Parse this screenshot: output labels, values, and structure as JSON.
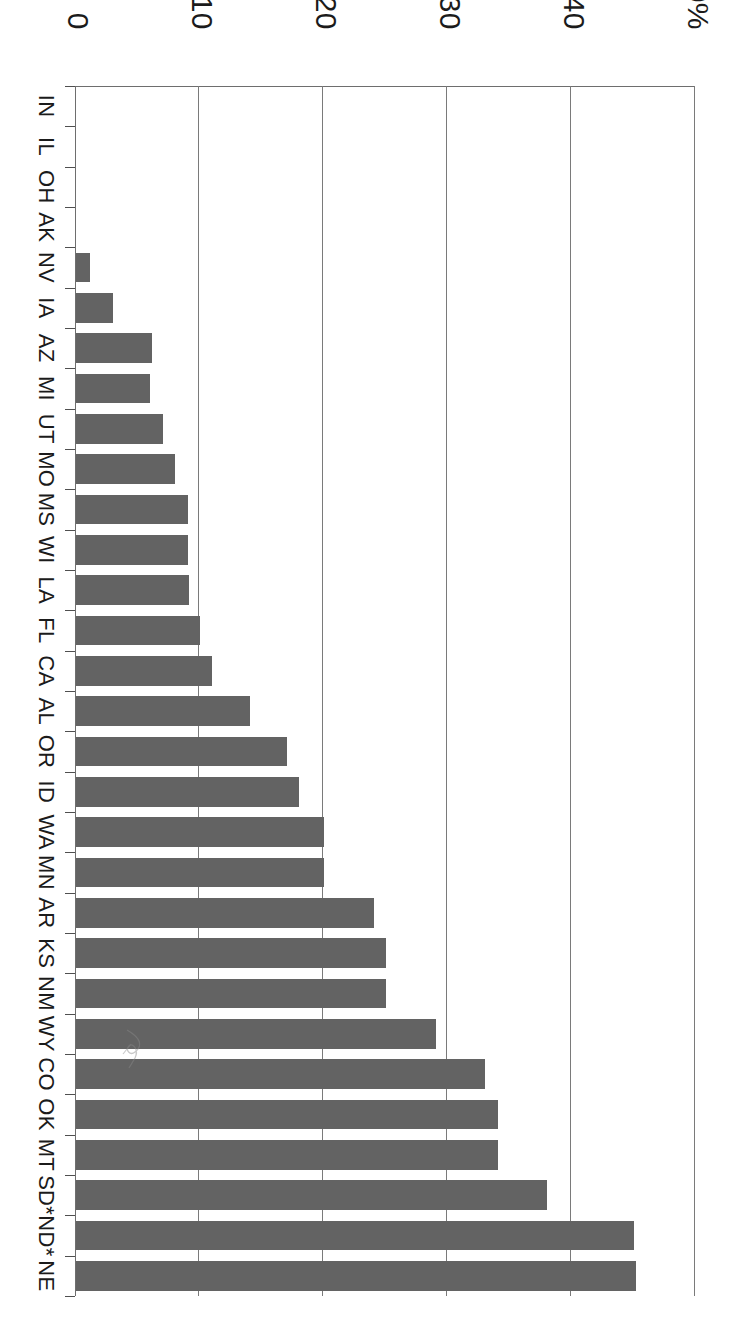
{
  "chart_data": {
    "type": "bar",
    "orientation": "vertical-in-natural-space",
    "title": "",
    "subtitle": "",
    "xlabel": "",
    "ylabel": "",
    "ylim": [
      0,
      50
    ],
    "grid": true,
    "legend": null,
    "y_tick_labels": [
      "0",
      "10",
      "20",
      "30",
      "40",
      "50%"
    ],
    "y_tick_values": [
      0,
      10,
      20,
      30,
      40,
      50
    ],
    "categories": [
      "IN",
      "IL",
      "OH",
      "AK",
      "NV",
      "IA",
      "AZ",
      "MI",
      "UT",
      "MO",
      "MS",
      "WI",
      "LA",
      "FL",
      "CA",
      "AL",
      "OR",
      "ID",
      "WA",
      "MN",
      "AR",
      "KS",
      "NM",
      "WY",
      "CO",
      "OK",
      "MT",
      "SD*",
      "ND*",
      "NE"
    ],
    "values": [
      0,
      0,
      0,
      0,
      1.1,
      3.0,
      6.1,
      6.0,
      7.0,
      8.0,
      9.0,
      9.0,
      9.1,
      10.0,
      11.0,
      14.0,
      17.0,
      18.0,
      20.0,
      20.0,
      24.0,
      25.0,
      25.0,
      29.0,
      33.0,
      34.0,
      34.0,
      38.0,
      45.0,
      45.2
    ],
    "bar_color": "#636363",
    "axis_color": "#6e6e6e"
  },
  "page": {
    "orientation_note": "sideways"
  }
}
